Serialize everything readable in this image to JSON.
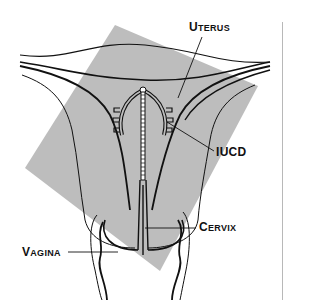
{
  "diagram": {
    "colors": {
      "background": "#ffffff",
      "highlight_region": "#bdbdbd",
      "line": "#111111",
      "divider": "#b8b8b8"
    },
    "labels": {
      "uterus": {
        "first": "U",
        "rest": "TERUS"
      },
      "iucd": "IUCD",
      "cervix": {
        "first": "C",
        "rest": "ERVIX"
      },
      "vagina": {
        "first": "V",
        "rest": "AGINA"
      }
    }
  }
}
